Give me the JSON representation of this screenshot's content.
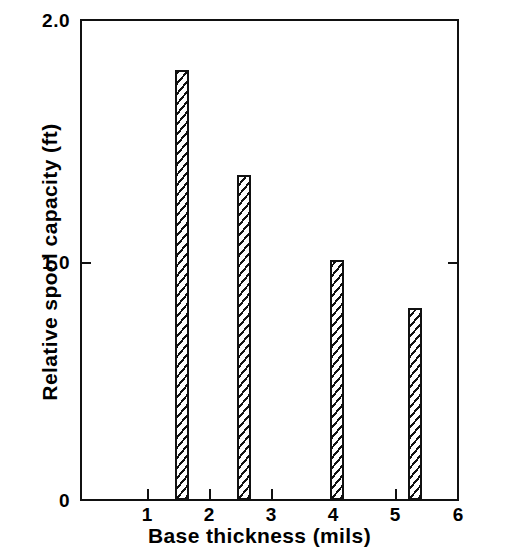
{
  "chart_data": {
    "type": "bar",
    "title": "",
    "subtitle": "",
    "xlabel": "Base thickness (mils)",
    "ylabel": "Relative spool capacity (ft)",
    "xlim": [
      0.5,
      6.0
    ],
    "ylim": [
      0.0,
      2.0
    ],
    "x_ticks": [
      1,
      2,
      3,
      4,
      5,
      6
    ],
    "x_tick_labels": [
      "1",
      "2",
      "3",
      "4",
      "5",
      "6"
    ],
    "y_ticks": [
      0,
      1.0,
      2.0
    ],
    "y_tick_labels": [
      "0",
      "1.0",
      "2.0"
    ],
    "grid": false,
    "legend": null,
    "bar_color": "#ffffff",
    "bar_edge_color": "#111111",
    "bar_hatch": "diagonal",
    "x": [
      1.55,
      2.55,
      4.05,
      5.3
    ],
    "values": [
      1.79,
      1.35,
      1.0,
      0.8
    ],
    "bars": [
      {
        "x": 1.55,
        "value": 1.79,
        "label": "1.55 mils"
      },
      {
        "x": 2.55,
        "value": 1.35,
        "label": "2.55 mils"
      },
      {
        "x": 4.05,
        "value": 1.0,
        "label": "4.05 mils"
      },
      {
        "x": 5.3,
        "value": 0.8,
        "label": "5.30 mils"
      }
    ]
  },
  "axes": {
    "x_title": "Base thickness (mils)",
    "y_title": "Relative spool capacity (ft)",
    "y_tick_top": "2.0",
    "y_tick_mid": "1.0",
    "y_tick_zero": "0",
    "x_tick_1": "1",
    "x_tick_2": "2",
    "x_tick_3": "3",
    "x_tick_4": "4",
    "x_tick_5": "5",
    "x_tick_6": "6"
  }
}
